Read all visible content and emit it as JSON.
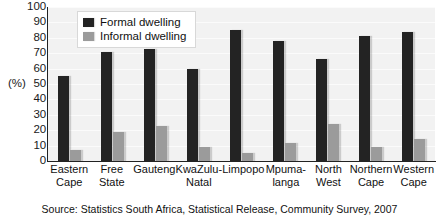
{
  "chart_data": {
    "type": "bar",
    "title": "",
    "subtitle": "",
    "xlabel": "",
    "ylabel": "(%)",
    "ylim": [
      0,
      100
    ],
    "yticks": [
      100,
      90,
      80,
      70,
      60,
      50,
      40,
      30,
      20,
      10,
      0
    ],
    "grid": true,
    "legend_position": "top-left-inside",
    "categories": [
      "Eastern Cape",
      "Free State",
      "Gauteng",
      "KwaZulu-Natal",
      "Limpopo",
      "Mpumalanga",
      "North West",
      "Northern Cape",
      "Western Cape"
    ],
    "category_lines": [
      [
        "Eastern",
        "Cape"
      ],
      [
        "Free",
        "State"
      ],
      [
        "Gauteng",
        ""
      ],
      [
        "KwaZulu-",
        "Natal"
      ],
      [
        "Limpopo",
        ""
      ],
      [
        "Mpuma-",
        "langa"
      ],
      [
        "North",
        "West"
      ],
      [
        "Northern",
        "Cape"
      ],
      [
        "Western",
        "Cape"
      ]
    ],
    "series": [
      {
        "name": "Formal dwelling",
        "color": "#232323",
        "values": [
          55,
          71,
          73,
          60,
          85,
          78,
          66,
          81,
          84
        ]
      },
      {
        "name": "Informal dwelling",
        "color": "#9b9b9b",
        "values": [
          7,
          19,
          23,
          9,
          5,
          12,
          24,
          9,
          14
        ]
      }
    ],
    "source": "Source: Statistics South Africa, Statistical Release, Community Survey, 2007"
  },
  "legend": {
    "items": [
      {
        "label": "Formal dwelling",
        "swatch": "formal"
      },
      {
        "label": "Informal dwelling",
        "swatch": "informal"
      }
    ]
  },
  "yaxis": {
    "unit_label": "(%)",
    "ticks": [
      "100",
      "90",
      "80",
      "70",
      "60",
      "50",
      "40",
      "30",
      "20",
      "10",
      "0"
    ]
  },
  "source_note": "Source: Statistics South Africa, Statistical Release, Community Survey, 2007"
}
